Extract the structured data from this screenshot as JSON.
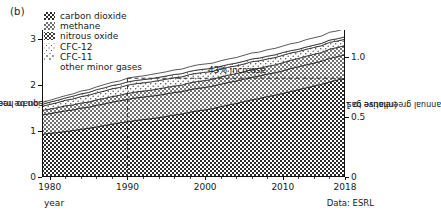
{
  "panel": {
    "label": "(b)"
  },
  "legend": {
    "items": [
      {
        "label": "carbon dioxide",
        "swatch": "dense-checker-dark"
      },
      {
        "label": "methane",
        "swatch": "checker-mid"
      },
      {
        "label": "nitrous oxide",
        "swatch": "dots-medium"
      },
      {
        "label": "CFC-12",
        "swatch": "dots-sparse"
      },
      {
        "label": "CFC-11",
        "swatch": "dots-faint"
      },
      {
        "label": "other minor gases",
        "swatch": "none"
      }
    ]
  },
  "annotations": [
    {
      "name": "increase-callout",
      "text": "43% increase"
    }
  ],
  "axes": {
    "left": {
      "title_line1": "contribution to heating imbalance",
      "title_line2": "(watts/square meter)",
      "ticks": [
        "0",
        "1",
        "2",
        "3"
      ]
    },
    "right": {
      "title_line1": "annual greenhouse gas index",
      "title_line2": "(relative to 1990)",
      "ticks": [
        "0",
        "0.5",
        "1.0"
      ]
    },
    "bottom": {
      "title": "year",
      "ticks": [
        "1980",
        "1990",
        "2000",
        "2010",
        "2018"
      ]
    }
  },
  "credit": {
    "text": "Data: ESRL"
  },
  "chart_data": {
    "type": "area",
    "title": "",
    "subtitle": "",
    "xlabel": "year",
    "ylabel": "contribution to heating imbalance (watts/square meter)",
    "y2label": "annual greenhouse gas index (relative to 1990)",
    "xlim": [
      1979,
      2018
    ],
    "ylim": [
      0,
      3.2
    ],
    "y2lim": [
      0,
      1.23
    ],
    "yticks": [
      0,
      1,
      2,
      3
    ],
    "y2ticks": [
      0,
      0.5,
      1.0
    ],
    "xticks": [
      1980,
      1990,
      2000,
      2010,
      2018
    ],
    "grid": false,
    "legend_position": "top-left-inside",
    "stacked": true,
    "x": [
      1979,
      1980,
      1981,
      1982,
      1983,
      1984,
      1985,
      1986,
      1987,
      1988,
      1989,
      1990,
      1991,
      1992,
      1993,
      1994,
      1995,
      1996,
      1997,
      1998,
      1999,
      2000,
      2001,
      2002,
      2003,
      2004,
      2005,
      2006,
      2007,
      2008,
      2009,
      2010,
      2011,
      2012,
      2013,
      2014,
      2015,
      2016,
      2017,
      2018
    ],
    "series": [
      {
        "name": "carbon dioxide",
        "values": [
          0.93,
          0.95,
          0.97,
          0.99,
          1.01,
          1.04,
          1.06,
          1.09,
          1.12,
          1.15,
          1.18,
          1.2,
          1.23,
          1.25,
          1.27,
          1.29,
          1.32,
          1.35,
          1.37,
          1.41,
          1.44,
          1.46,
          1.49,
          1.53,
          1.57,
          1.6,
          1.64,
          1.68,
          1.71,
          1.75,
          1.78,
          1.82,
          1.86,
          1.9,
          1.94,
          1.98,
          2.02,
          2.07,
          2.11,
          2.15
        ]
      },
      {
        "name": "methane",
        "values": [
          0.42,
          0.43,
          0.44,
          0.45,
          0.45,
          0.46,
          0.46,
          0.47,
          0.47,
          0.48,
          0.48,
          0.49,
          0.49,
          0.49,
          0.49,
          0.49,
          0.49,
          0.49,
          0.49,
          0.49,
          0.49,
          0.49,
          0.49,
          0.49,
          0.49,
          0.49,
          0.49,
          0.49,
          0.49,
          0.49,
          0.49,
          0.49,
          0.5,
          0.5,
          0.5,
          0.5,
          0.5,
          0.51,
          0.51,
          0.51
        ]
      },
      {
        "name": "nitrous oxide",
        "values": [
          0.1,
          0.1,
          0.1,
          0.11,
          0.11,
          0.11,
          0.11,
          0.12,
          0.12,
          0.12,
          0.12,
          0.13,
          0.13,
          0.13,
          0.13,
          0.14,
          0.14,
          0.14,
          0.14,
          0.15,
          0.15,
          0.15,
          0.15,
          0.16,
          0.16,
          0.16,
          0.16,
          0.17,
          0.17,
          0.17,
          0.17,
          0.18,
          0.18,
          0.18,
          0.19,
          0.19,
          0.19,
          0.2,
          0.2,
          0.2
        ]
      },
      {
        "name": "CFC-12",
        "values": [
          0.09,
          0.1,
          0.11,
          0.12,
          0.13,
          0.14,
          0.15,
          0.15,
          0.16,
          0.17,
          0.17,
          0.18,
          0.18,
          0.18,
          0.18,
          0.18,
          0.18,
          0.18,
          0.18,
          0.18,
          0.18,
          0.18,
          0.17,
          0.17,
          0.17,
          0.17,
          0.17,
          0.17,
          0.16,
          0.16,
          0.16,
          0.16,
          0.16,
          0.15,
          0.15,
          0.15,
          0.15,
          0.15,
          0.14,
          0.14
        ]
      },
      {
        "name": "CFC-11",
        "values": [
          0.04,
          0.05,
          0.05,
          0.05,
          0.06,
          0.06,
          0.06,
          0.07,
          0.07,
          0.07,
          0.07,
          0.07,
          0.07,
          0.07,
          0.07,
          0.07,
          0.07,
          0.07,
          0.07,
          0.07,
          0.07,
          0.07,
          0.07,
          0.06,
          0.06,
          0.06,
          0.06,
          0.06,
          0.06,
          0.06,
          0.06,
          0.06,
          0.05,
          0.05,
          0.05,
          0.05,
          0.05,
          0.05,
          0.05,
          0.05
        ]
      },
      {
        "name": "other minor gases",
        "values": [
          0.04,
          0.04,
          0.05,
          0.05,
          0.05,
          0.06,
          0.06,
          0.06,
          0.07,
          0.07,
          0.07,
          0.08,
          0.08,
          0.08,
          0.09,
          0.09,
          0.09,
          0.1,
          0.1,
          0.1,
          0.11,
          0.11,
          0.11,
          0.12,
          0.12,
          0.12,
          0.13,
          0.13,
          0.13,
          0.14,
          0.14,
          0.14,
          0.15,
          0.15,
          0.16,
          0.16,
          0.16,
          0.17,
          0.17,
          0.18
        ]
      }
    ],
    "totals": [
      1.62,
      1.67,
      1.72,
      1.77,
      1.81,
      1.87,
      1.9,
      1.96,
      2.01,
      2.06,
      2.09,
      2.15,
      2.18,
      2.2,
      2.23,
      2.26,
      2.29,
      2.33,
      2.35,
      2.4,
      2.44,
      2.46,
      2.48,
      2.53,
      2.57,
      2.6,
      2.65,
      2.7,
      2.72,
      2.77,
      2.8,
      2.85,
      2.9,
      2.93,
      2.99,
      3.03,
      3.07,
      3.15,
      3.18,
      3.23
    ],
    "annotation": {
      "text": "43% increase",
      "from_year": 1990,
      "reference_value": 2.15
    }
  }
}
